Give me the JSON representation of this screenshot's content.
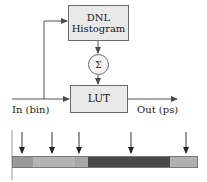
{
  "diagram": {
    "blocks": {
      "dnl": {
        "line1": "DNL",
        "line2": "Histogram"
      },
      "lut": {
        "label": "LUT"
      },
      "sum": {
        "label": "Σ"
      }
    },
    "labels": {
      "input": "In (bin)",
      "output": "Out (ps)"
    },
    "colors": {
      "box_fill": "#e9e9e9",
      "box_stroke": "#6a6a6a",
      "line": "#555555",
      "text": "#1a1a1a"
    }
  },
  "bin_bar": {
    "segments": [
      {
        "name": "bin-1",
        "color": "#9a9a9a",
        "width": 20
      },
      {
        "name": "bin-2",
        "color": "#b4b4b4",
        "width": 42
      },
      {
        "name": "bin-3",
        "color": "#a8a8a8",
        "width": 13
      },
      {
        "name": "bin-4",
        "color": "#4a4a4a",
        "width": 82
      },
      {
        "name": "bin-5",
        "color": "#b0b0b0",
        "width": 27
      }
    ],
    "arrows": [
      {
        "name": "arrow-1",
        "x": 22
      },
      {
        "name": "arrow-2",
        "x": 52
      },
      {
        "name": "arrow-3",
        "x": 79
      },
      {
        "name": "arrow-4",
        "x": 131
      },
      {
        "name": "arrow-5",
        "x": 186
      }
    ]
  }
}
